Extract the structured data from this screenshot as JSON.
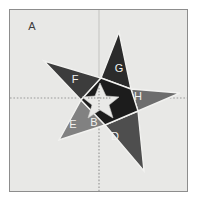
{
  "figure": {
    "frame": {
      "background_color": "#e8e8e6",
      "border_color": "#8d8d8d",
      "outer_background": "#ffffff"
    },
    "axes": {
      "style": "dotted",
      "color": "#9a9a9a",
      "horizontal_y": 97,
      "vertical_x": 99,
      "vertical_top_solid_color": "#c8c8c6"
    },
    "colors": {
      "region_A": "#e8e8e6",
      "region_B": "#1c1c1c",
      "region_D": "#4e4e4e",
      "region_E": "#818181",
      "region_F": "#3c3c3c",
      "region_G": "#2b2b2b",
      "region_H": "#6d6d6d",
      "inner_star": "#e9e9e7",
      "outline": "#f2f2f0"
    },
    "labels": [
      {
        "id": "A",
        "text": "A",
        "x": 31,
        "y": 26,
        "tone": "dark"
      },
      {
        "id": "F",
        "text": "F",
        "x": 74,
        "y": 79,
        "tone": "light"
      },
      {
        "id": "G",
        "text": "G",
        "x": 118,
        "y": 68,
        "tone": "light"
      },
      {
        "id": "H",
        "text": "H",
        "x": 137,
        "y": 96,
        "tone": "light"
      },
      {
        "id": "E",
        "text": "E",
        "x": 72,
        "y": 124,
        "tone": "light"
      },
      {
        "id": "B",
        "text": "B",
        "x": 93,
        "y": 122,
        "tone": "light"
      },
      {
        "id": "D",
        "text": "D",
        "x": 114,
        "y": 136,
        "tone": "light"
      }
    ],
    "regions": [
      {
        "id": "A",
        "name": "background-plane",
        "label": "A"
      },
      {
        "id": "B",
        "name": "inner-pentagon",
        "label": "B"
      },
      {
        "id": "D",
        "name": "star-point-bottom",
        "label": "D"
      },
      {
        "id": "E",
        "name": "star-point-lower-left",
        "label": "E"
      },
      {
        "id": "F",
        "name": "star-point-upper-left",
        "label": "F"
      },
      {
        "id": "G",
        "name": "star-point-top",
        "label": "G"
      },
      {
        "id": "H",
        "name": "star-point-right",
        "label": "H"
      }
    ],
    "geometry": {
      "outer_star_points": "119,31 131,88 180,92 138,110 144,170 105,124 59,139 81,99 44,60 101,77",
      "point_G": "119,31 131,88 101,77",
      "point_H": "131,88 180,92 138,110",
      "point_D": "138,110 144,170 105,124",
      "point_E": "105,124 59,139 81,99",
      "point_F": "81,99 44,60 101,77",
      "pentagon_B": "101,77 131,88 138,110 105,124 81,99",
      "inner_star": "100,82 106,95 119,96 109,104 113,117 100,109 88,117 92,104 82,96 95,95"
    }
  }
}
